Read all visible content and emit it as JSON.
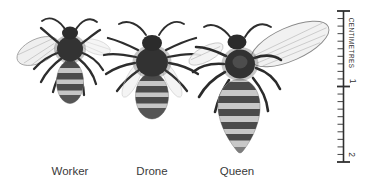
{
  "figure": {
    "bees": [
      {
        "id": "worker",
        "label": "Worker"
      },
      {
        "id": "drone",
        "label": "Drone"
      },
      {
        "id": "queen",
        "label": "Queen"
      }
    ],
    "ruler": {
      "unit_label": "CENTIMETRES",
      "start_cm": 0,
      "end_cm": 2,
      "tick_labels": [
        "1",
        "2"
      ],
      "minor_ticks_per_cm": 10,
      "color": "#2f2f2f"
    },
    "colors": {
      "background": "#ffffff",
      "ink": "#2d2d2d",
      "label_text": "#3a3a3a",
      "stripe_dark": "#4b4b4b",
      "stripe_light": "#c6c6c6",
      "wing_fill": "#f0f0f0"
    }
  }
}
